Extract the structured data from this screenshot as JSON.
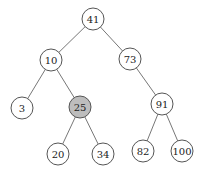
{
  "diagram": {
    "type": "binary-search-tree",
    "highlight_color": "#bdbdbd",
    "nodes": [
      {
        "id": "n41",
        "label": "41",
        "x": 93,
        "y": 19,
        "highlighted": false
      },
      {
        "id": "n10",
        "label": "10",
        "x": 51,
        "y": 60,
        "highlighted": false
      },
      {
        "id": "n73",
        "label": "73",
        "x": 130,
        "y": 59,
        "highlighted": false
      },
      {
        "id": "n3",
        "label": "3",
        "x": 22,
        "y": 108,
        "highlighted": false
      },
      {
        "id": "n25",
        "label": "25",
        "x": 80,
        "y": 107,
        "highlighted": true
      },
      {
        "id": "n91",
        "label": "91",
        "x": 162,
        "y": 104,
        "highlighted": false
      },
      {
        "id": "n20",
        "label": "20",
        "x": 58,
        "y": 154,
        "highlighted": false
      },
      {
        "id": "n34",
        "label": "34",
        "x": 103,
        "y": 154,
        "highlighted": false
      },
      {
        "id": "n82",
        "label": "82",
        "x": 143,
        "y": 151,
        "highlighted": false
      },
      {
        "id": "n100",
        "label": "100",
        "x": 182,
        "y": 151,
        "highlighted": false
      }
    ],
    "edges": [
      [
        "n41",
        "n10"
      ],
      [
        "n41",
        "n73"
      ],
      [
        "n10",
        "n3"
      ],
      [
        "n10",
        "n25"
      ],
      [
        "n73",
        "n91"
      ],
      [
        "n25",
        "n20"
      ],
      [
        "n25",
        "n34"
      ],
      [
        "n91",
        "n82"
      ],
      [
        "n91",
        "n100"
      ]
    ]
  }
}
